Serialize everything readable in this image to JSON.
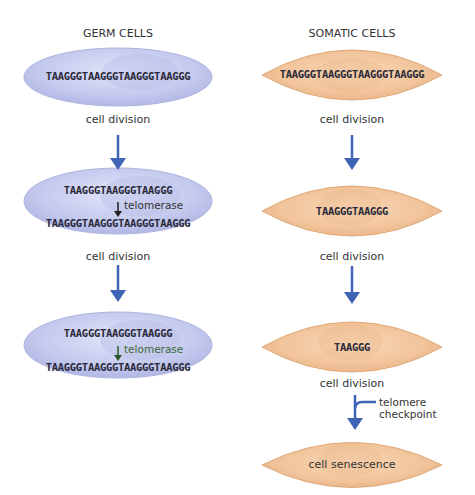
{
  "columns": {
    "germ": {
      "title": "GERM CELLS",
      "cells": [
        {
          "seq_top": "TAAGGGTAAGGGTAAGGGTAAGGG"
        },
        {
          "seq_top": "TAAGGGTAAGGGTAAGGG",
          "enzyme": "telomerase",
          "seq_bottom": "TAAGGGTAAGGGTAAGGGTAAGGG"
        },
        {
          "seq_top": "TAAGGGTAAGGGTAAGGG",
          "enzyme": "telomerase",
          "seq_bottom": "TAAGGGTAAGGGTAAGGGTAAGGG"
        }
      ],
      "division_labels": [
        "cell division",
        "cell division"
      ]
    },
    "somatic": {
      "title": "SOMATIC CELLS",
      "cells": [
        {
          "seq": "TAAGGGTAAGGGTAAGGGTAAGGG"
        },
        {
          "seq": "TAAGGGTAAGGG"
        },
        {
          "seq": "TAAGGG"
        },
        {
          "seq": "cell senescence"
        }
      ],
      "division_labels": [
        "cell division",
        "cell division",
        "cell division"
      ],
      "checkpoint_label_1": "telomere",
      "checkpoint_label_2": "checkpoint"
    }
  },
  "colors": {
    "arrow": "#3f63b5",
    "germ_cell": "#c3c8ee",
    "somatic_cell": "#f2c59c",
    "somatic_edge": "#e0a878"
  }
}
